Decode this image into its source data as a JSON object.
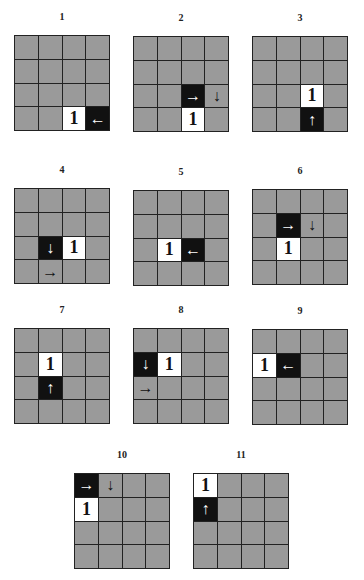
{
  "colors": {
    "empty": "#9a9a9a",
    "highlight": "#ffffff",
    "agent": "#111111",
    "grid_line": "#222222"
  },
  "panels": [
    {
      "label": "1",
      "x": 14,
      "y": 35,
      "cells": [
        {
          "r": 3,
          "c": 2,
          "type": "white",
          "text": "1"
        },
        {
          "r": 3,
          "c": 3,
          "type": "black",
          "text": "←"
        }
      ]
    },
    {
      "label": "2",
      "x": 133,
      "y": 36,
      "cells": [
        {
          "r": 2,
          "c": 2,
          "type": "black",
          "text": "→"
        },
        {
          "r": 2,
          "c": 3,
          "type": "gray",
          "text": "↓"
        },
        {
          "r": 3,
          "c": 2,
          "type": "white",
          "text": "1"
        }
      ]
    },
    {
      "label": "3",
      "x": 252,
      "y": 36,
      "cells": [
        {
          "r": 2,
          "c": 2,
          "type": "white",
          "text": "1"
        },
        {
          "r": 3,
          "c": 2,
          "type": "black",
          "text": "↑"
        }
      ]
    },
    {
      "label": "4",
      "x": 14,
      "y": 188,
      "cells": [
        {
          "r": 2,
          "c": 1,
          "type": "black",
          "text": "↓"
        },
        {
          "r": 2,
          "c": 2,
          "type": "white",
          "text": "1"
        },
        {
          "r": 3,
          "c": 1,
          "type": "gray",
          "text": "→"
        }
      ]
    },
    {
      "label": "5",
      "x": 133,
      "y": 190,
      "cells": [
        {
          "r": 2,
          "c": 1,
          "type": "white",
          "text": "1"
        },
        {
          "r": 2,
          "c": 2,
          "type": "black",
          "text": "←"
        }
      ]
    },
    {
      "label": "6",
      "x": 252,
      "y": 189,
      "cells": [
        {
          "r": 1,
          "c": 1,
          "type": "black",
          "text": "→"
        },
        {
          "r": 1,
          "c": 2,
          "type": "gray",
          "text": "↓"
        },
        {
          "r": 2,
          "c": 1,
          "type": "white",
          "text": "1"
        }
      ]
    },
    {
      "label": "7",
      "x": 14,
      "y": 328,
      "cells": [
        {
          "r": 1,
          "c": 1,
          "type": "white",
          "text": "1"
        },
        {
          "r": 2,
          "c": 1,
          "type": "black",
          "text": "↑"
        }
      ]
    },
    {
      "label": "8",
      "x": 133,
      "y": 328,
      "cells": [
        {
          "r": 1,
          "c": 0,
          "type": "black",
          "text": "↓"
        },
        {
          "r": 1,
          "c": 1,
          "type": "white",
          "text": "1"
        },
        {
          "r": 2,
          "c": 0,
          "type": "gray",
          "text": "→"
        }
      ]
    },
    {
      "label": "9",
      "x": 252,
      "y": 329,
      "cells": [
        {
          "r": 1,
          "c": 0,
          "type": "white",
          "text": "1"
        },
        {
          "r": 1,
          "c": 1,
          "type": "black",
          "text": "←"
        }
      ]
    },
    {
      "label": "10",
      "x": 74,
      "y": 473,
      "cells": [
        {
          "r": 0,
          "c": 0,
          "type": "black",
          "text": "→"
        },
        {
          "r": 0,
          "c": 1,
          "type": "gray",
          "text": "↓"
        },
        {
          "r": 1,
          "c": 0,
          "type": "white",
          "text": "1"
        }
      ]
    },
    {
      "label": "11",
      "x": 193,
      "y": 473,
      "cells": [
        {
          "r": 0,
          "c": 0,
          "type": "white",
          "text": "1"
        },
        {
          "r": 1,
          "c": 0,
          "type": "black",
          "text": "↑"
        }
      ]
    }
  ]
}
